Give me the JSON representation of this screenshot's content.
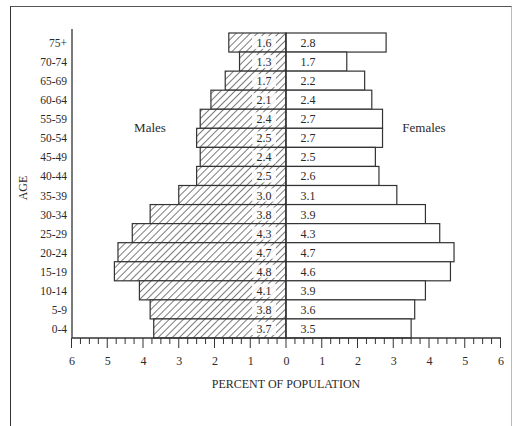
{
  "chart_data": {
    "type": "bar",
    "orientation": "horizontal",
    "subtype": "population-pyramid",
    "title": "",
    "xlabel": "PERCENT OF POPULATION",
    "ylabel": "AGE",
    "xlim": [
      -6,
      6
    ],
    "x_ticks": [
      "6",
      "5",
      "4",
      "3",
      "2",
      "1",
      "0",
      "1",
      "2",
      "3",
      "4",
      "5",
      "6"
    ],
    "grid": false,
    "legend": "none",
    "annotations": [
      "Males",
      "Females"
    ],
    "categories": [
      "75+",
      "70-74",
      "65-69",
      "60-64",
      "55-59",
      "50-54",
      "45-49",
      "40-44",
      "35-39",
      "30-34",
      "25-29",
      "20-24",
      "15-19",
      "10-14",
      "5-9",
      "0-4"
    ],
    "series": [
      {
        "name": "Males",
        "side": "left",
        "pattern": "hatched",
        "values": [
          1.6,
          1.3,
          1.7,
          2.1,
          2.4,
          2.5,
          2.4,
          2.5,
          3.0,
          3.8,
          4.3,
          4.7,
          4.8,
          4.1,
          3.8,
          3.7
        ]
      },
      {
        "name": "Females",
        "side": "right",
        "pattern": "open",
        "values": [
          2.8,
          1.7,
          2.2,
          2.4,
          2.7,
          2.7,
          2.5,
          2.6,
          3.1,
          3.9,
          4.3,
          4.7,
          4.6,
          3.9,
          3.6,
          3.5
        ]
      }
    ]
  },
  "labels": {
    "males": "Males",
    "females": "Females",
    "x_axis": "PERCENT OF POPULATION",
    "y_axis": "AGE"
  }
}
